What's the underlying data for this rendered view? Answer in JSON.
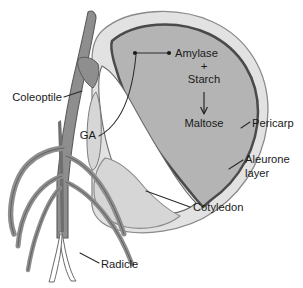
{
  "figure": {
    "background_color": "#ffffff"
  },
  "labels": {
    "coleoptile": "Coleoptile",
    "ga": "GA",
    "amylase": "Amylase",
    "plus": "+",
    "starch": "Starch",
    "maltose": "Maltose",
    "pericarp": "Pericarp",
    "aleurone_line1": "Aleurone",
    "aleurone_line2": "layer",
    "cotyledon": "Cotyledon",
    "radicle": "Radicle"
  },
  "colors": {
    "text": "#1a1a1a",
    "leader_line": "#2a2a2a",
    "pericarp_fill": "#e2e2e2",
    "pericarp_stroke": "#8a8a8a",
    "endosperm_fill": "#b4b4b4",
    "aleurone_stroke": "#4a4a4a",
    "cotyledon_fill": "#d6d6d6",
    "embryo_cavity_fill": "#ffffff",
    "shoot_fill": "#8e8e8e",
    "shoot_stroke": "#5a5a5a",
    "root_fill": "#8e8e8e",
    "root_stroke": "#5a5a5a",
    "radicle_fill": "#ffffff"
  },
  "structures": [
    {
      "name": "coleoptile",
      "description": "pointed shoot blade emerging upward at left"
    },
    {
      "name": "pericarp",
      "description": "thin outer seed coat shell"
    },
    {
      "name": "aleurone-layer",
      "description": "thick dark border enclosing endosperm"
    },
    {
      "name": "endosperm",
      "description": "large gray starch storage region"
    },
    {
      "name": "cotyledon",
      "description": "scutellum, light gray region at lower left of seed"
    },
    {
      "name": "radicle",
      "description": "primary root emerging downward"
    },
    {
      "name": "roots",
      "description": "lateral seminal roots curving outward"
    }
  ],
  "reaction": {
    "substrate_line1": "Amylase",
    "substrate_plus": "+",
    "substrate_line2": "Starch",
    "product": "Maltose",
    "direction": "downward"
  }
}
